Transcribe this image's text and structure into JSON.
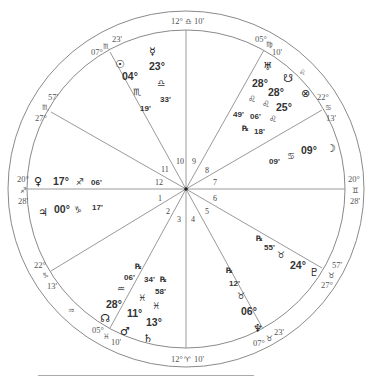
{
  "chart": {
    "type": "natal-wheel",
    "center": [
      186,
      189
    ],
    "outer_radius": 178,
    "inner_radius": 159,
    "house_numbers": [
      "1",
      "2",
      "3",
      "4",
      "5",
      "6",
      "7",
      "8",
      "9",
      "10",
      "11",
      "12"
    ],
    "cusps": [
      {
        "house": "MC",
        "deg": "12°",
        "sign": "♎",
        "min": "10'"
      },
      {
        "house": "IC",
        "deg": "12°",
        "sign": "♈",
        "min": "10'"
      },
      {
        "house": "11",
        "deg": "07°",
        "sign": "♏",
        "min": "23'"
      },
      {
        "house": "12",
        "deg": "27°",
        "sign": "♏",
        "min": "57'"
      },
      {
        "house": "ASC",
        "deg": "20°",
        "sign": "♐",
        "min": "28'"
      },
      {
        "house": "2",
        "deg": "22°",
        "sign": "♑",
        "min": "13'"
      },
      {
        "house": "2b",
        "sign": "♒"
      },
      {
        "house": "3",
        "deg": "05°",
        "sign": "♓",
        "min": "10'"
      },
      {
        "house": "9",
        "deg": "05°",
        "sign": "♍",
        "min": "10'"
      },
      {
        "house": "9b",
        "sign": "♌"
      },
      {
        "house": "8",
        "deg": "22°",
        "sign": "♋",
        "min": "13'"
      },
      {
        "house": "DSC",
        "deg": "20°",
        "sign": "♊",
        "min": "28'"
      },
      {
        "house": "6",
        "deg": "27°",
        "sign": "♉",
        "min": "57'"
      },
      {
        "house": "5",
        "deg": "07°",
        "sign": "♉",
        "min": "23'"
      }
    ],
    "planets": [
      {
        "name": "Sun",
        "glyph": "☉",
        "deg": "04°",
        "sign": "♏",
        "min": "19'"
      },
      {
        "name": "Mercury",
        "glyph": "☿",
        "deg": "23°",
        "sign": "♎",
        "min": "33'"
      },
      {
        "name": "Uranus",
        "glyph": "♅",
        "deg": "28°",
        "sign": "♌",
        "min": "49'",
        "retro": "℞"
      },
      {
        "name": "South Node",
        "glyph": "☋",
        "deg": "28°",
        "sign": "♌",
        "min": "06'"
      },
      {
        "name": "Part of Fortune",
        "glyph": "⊗",
        "deg": "25°",
        "sign": "♌",
        "min": "18'"
      },
      {
        "name": "Moon",
        "glyph": "☽",
        "deg": "09°",
        "sign": "♋",
        "min": "09'"
      },
      {
        "name": "Venus",
        "glyph": "♀",
        "deg": "17°",
        "sign": "♐",
        "min": "06'"
      },
      {
        "name": "Jupiter",
        "glyph": "♃",
        "deg": "00°",
        "sign": "♑",
        "min": "17'"
      },
      {
        "name": "North Node",
        "glyph": "☊",
        "deg": "28°",
        "sign": "♒",
        "min": "06'",
        "retro": "℞"
      },
      {
        "name": "Mars",
        "glyph": "♂",
        "deg": "11°",
        "sign": "♓",
        "min": "34'",
        "retro": "℞"
      },
      {
        "name": "Saturn",
        "glyph": "♄",
        "deg": "13°",
        "sign": "♓",
        "min": "58'"
      },
      {
        "name": "Pluto",
        "glyph": "♇",
        "deg": "24°",
        "sign": "♉",
        "min": "55'",
        "retro": "℞"
      },
      {
        "name": "Neptune",
        "glyph": "♆",
        "deg": "06°",
        "sign": "♉",
        "min": "12'",
        "retro": "℞"
      }
    ]
  }
}
